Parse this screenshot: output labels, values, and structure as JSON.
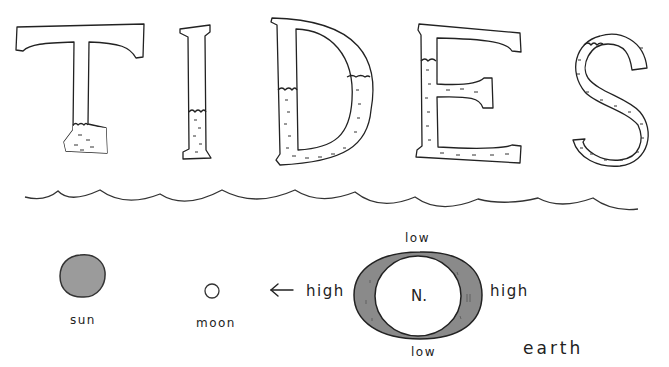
{
  "title": {
    "letters": [
      "T",
      "I",
      "D",
      "E",
      "S"
    ],
    "word": "TIDES"
  },
  "diagram": {
    "bodies": {
      "sun": {
        "label": "sun",
        "fill": "#9b9b9b"
      },
      "moon": {
        "label": "moon"
      },
      "earth": {
        "label": "earth",
        "center_label": "N.",
        "bulge_fill": "#8a8a8a"
      }
    },
    "tide_labels": {
      "left": "high",
      "right": "high",
      "top": "low",
      "bottom": "low"
    },
    "arrow": "left-arrow"
  },
  "colors": {
    "ink": "#222222",
    "background": "#ffffff",
    "water_dash": "#333333"
  }
}
